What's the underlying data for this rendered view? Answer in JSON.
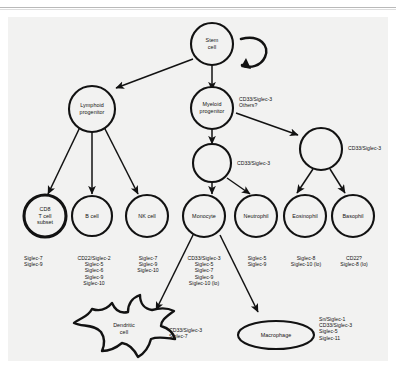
{
  "figure": {
    "nodes": [
      {
        "id": "stem",
        "label": "Stem\ncell",
        "shape": "circle"
      },
      {
        "id": "lymphoid",
        "label": "Lymphoid\nprogenitor",
        "shape": "circle"
      },
      {
        "id": "myeloid",
        "label": "Myeloid\nprogenitor",
        "shape": "circle"
      },
      {
        "id": "mid-blank",
        "label": "",
        "shape": "circle"
      },
      {
        "id": "right-blank",
        "label": "",
        "shape": "circle"
      },
      {
        "id": "cd8",
        "label": "CD8\nT cell\nsubset",
        "shape": "circle"
      },
      {
        "id": "bcell",
        "label": "B cell",
        "shape": "circle"
      },
      {
        "id": "nkcell",
        "label": "NK cell",
        "shape": "circle"
      },
      {
        "id": "monocyte",
        "label": "Monocyte",
        "shape": "circle"
      },
      {
        "id": "neutrophil",
        "label": "Neutrophil",
        "shape": "circle"
      },
      {
        "id": "eosinophil",
        "label": "Eosinophil",
        "shape": "circle"
      },
      {
        "id": "basophil",
        "label": "Basophil",
        "shape": "circle"
      },
      {
        "id": "dendritic",
        "label": "Dendritic\ncell",
        "shape": "star"
      },
      {
        "id": "macrophage",
        "label": "Macrophage",
        "shape": "ellipse"
      }
    ],
    "edge_labels": {
      "myeloid_to_right": "CD33/Siglec-3\nOthers?",
      "right_blank": "CD33/Siglec-3",
      "mid_blank": "CD33/Siglec-3"
    },
    "annotations": {
      "cd8": "Siglec-7\nSiglec-9",
      "bcell": "CD22/Siglec-2\nSiglec-5\nSiglec-6\nSiglec-9\nSiglec-10",
      "nkcell": "Siglec-7\nSiglec-9\nSiglec-10",
      "monocyte": "CD33/Siglec-3\nSiglec-5\nSiglec-7\nSiglec-9\nSiglec-10 (lo)",
      "neutrophil": "Siglec-5\nSiglec-9",
      "eosinophil": "Siglec-8\nSiglec-10 (lo)",
      "basophil": "CD22?\nSiglec-8 (lo)",
      "dendritic": "CD33/Siglec-3\nSiglec-7",
      "macrophage": "Sn/Siglec-1\nCD33/Siglec-3\nSiglec-5\nSiglec-11"
    },
    "colors": {
      "ink": "#121212",
      "paper": "#f2f2f1",
      "page": "#ffffff"
    }
  }
}
